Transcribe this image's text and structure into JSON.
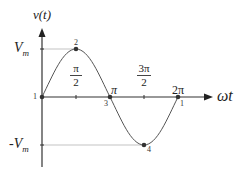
{
  "diagram": {
    "y_axis_label": "v(t)",
    "x_axis_label": "ωt",
    "amplitude_pos_label": "V",
    "amplitude_pos_sub": "m",
    "amplitude_neg_label": "-V",
    "amplitude_neg_sub": "m",
    "tick_labels": {
      "half_pi_num": "π",
      "half_pi_den": "2",
      "pi": "π",
      "three_half_pi_num": "3π",
      "three_half_pi_den": "2",
      "two_pi": "2π"
    },
    "points": [
      {
        "id": "1",
        "label": "1",
        "phase": "0"
      },
      {
        "id": "2",
        "label": "2",
        "phase": "π/2"
      },
      {
        "id": "3",
        "label": "3",
        "phase": "π"
      },
      {
        "id": "4",
        "label": "4",
        "phase": "3π/2"
      },
      {
        "id": "5",
        "label": "1",
        "phase": "2π"
      }
    ],
    "colors": {
      "axis": "#333333",
      "curve": "#555555",
      "guide": "#aaaaaa",
      "point": "#333333"
    }
  }
}
